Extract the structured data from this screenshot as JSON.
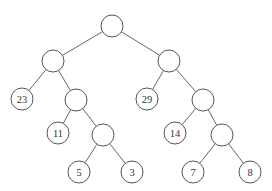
{
  "diagram": {
    "type": "binary-tree",
    "node_radius": 11,
    "nodes": [
      {
        "id": "root",
        "x": 112,
        "y": 26,
        "label": ""
      },
      {
        "id": "l1",
        "x": 53,
        "y": 61,
        "label": ""
      },
      {
        "id": "r1",
        "x": 169,
        "y": 61,
        "label": ""
      },
      {
        "id": "n23",
        "x": 22,
        "y": 99,
        "label": "23"
      },
      {
        "id": "l2",
        "x": 76,
        "y": 100,
        "label": ""
      },
      {
        "id": "n29",
        "x": 147,
        "y": 99,
        "label": "29"
      },
      {
        "id": "r2",
        "x": 203,
        "y": 100,
        "label": ""
      },
      {
        "id": "n11",
        "x": 58,
        "y": 133,
        "label": "11"
      },
      {
        "id": "l3",
        "x": 103,
        "y": 135,
        "label": ""
      },
      {
        "id": "n14",
        "x": 175,
        "y": 133,
        "label": "14"
      },
      {
        "id": "r3",
        "x": 222,
        "y": 135,
        "label": ""
      },
      {
        "id": "n5",
        "x": 79,
        "y": 172,
        "label": "5"
      },
      {
        "id": "n3",
        "x": 132,
        "y": 172,
        "label": "3"
      },
      {
        "id": "n7",
        "x": 193,
        "y": 172,
        "label": "7"
      },
      {
        "id": "n8",
        "x": 250,
        "y": 172,
        "label": "8"
      }
    ],
    "edges": [
      [
        "root",
        "l1"
      ],
      [
        "root",
        "r1"
      ],
      [
        "l1",
        "n23"
      ],
      [
        "l1",
        "l2"
      ],
      [
        "r1",
        "n29"
      ],
      [
        "r1",
        "r2"
      ],
      [
        "l2",
        "n11"
      ],
      [
        "l2",
        "l3"
      ],
      [
        "r2",
        "n14"
      ],
      [
        "r2",
        "r3"
      ],
      [
        "l3",
        "n5"
      ],
      [
        "l3",
        "n3"
      ],
      [
        "r3",
        "n7"
      ],
      [
        "r3",
        "n8"
      ]
    ]
  }
}
